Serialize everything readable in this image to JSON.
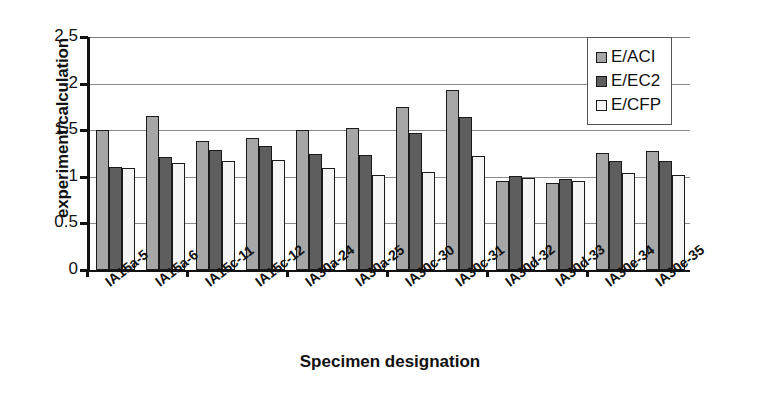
{
  "chart_data": {
    "type": "bar",
    "title": "",
    "xlabel": "Specimen designation",
    "ylabel": "experiment/calculation",
    "ylim": [
      0,
      2.5
    ],
    "ytick_labels": [
      "0",
      "0.5",
      "1",
      "1.5",
      "2",
      "2.5"
    ],
    "ytick_values": [
      0,
      0.5,
      1,
      1.5,
      2,
      2.5
    ],
    "grid": true,
    "legend_position": "top-right",
    "categories": [
      "IA15a-5",
      "IA15a-6",
      "IA15c-11",
      "IA15c-12",
      "IA30a-24",
      "IA30a-25",
      "IA30c-30",
      "IA30c-31",
      "IA30d-32",
      "IA30d-33",
      "IA30e-34",
      "IA30e-35"
    ],
    "series": [
      {
        "name": "E/ACI",
        "color": "#a6a6a6",
        "values": [
          1.5,
          1.65,
          1.38,
          1.42,
          1.5,
          1.52,
          1.75,
          1.93,
          0.96,
          0.93,
          1.26,
          1.28
        ]
      },
      {
        "name": "E/EC2",
        "color": "#5e5e5e",
        "values": [
          1.1,
          1.21,
          1.29,
          1.33,
          1.25,
          1.23,
          1.47,
          1.64,
          1.01,
          0.98,
          1.17,
          1.17
        ]
      },
      {
        "name": "E/CFP",
        "color": "#f4f4f4",
        "values": [
          1.09,
          1.15,
          1.17,
          1.18,
          1.09,
          1.02,
          1.05,
          1.22,
          0.99,
          0.95,
          1.04,
          1.02
        ]
      }
    ]
  },
  "legend": {
    "items": [
      {
        "label": "E/ACI",
        "swatch": "swatch-gray-medium"
      },
      {
        "label": "E/EC2",
        "swatch": "swatch-gray-dark"
      },
      {
        "label": "E/CFP",
        "swatch": "swatch-white"
      }
    ]
  }
}
